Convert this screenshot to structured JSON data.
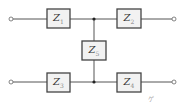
{
  "diagram": {
    "type": "two-port impedance network",
    "components": [
      {
        "id": "Z1",
        "symbol": "Z",
        "subscript": "1",
        "position": "top-left"
      },
      {
        "id": "Z2",
        "symbol": "Z",
        "subscript": "2",
        "position": "top-right"
      },
      {
        "id": "Z5",
        "symbol": "Z",
        "subscript": "5",
        "position": "center-shunt"
      },
      {
        "id": "Z3",
        "symbol": "Z",
        "subscript": "3",
        "position": "bottom-left"
      },
      {
        "id": "Z4",
        "symbol": "Z",
        "subscript": "4",
        "position": "bottom-right"
      }
    ],
    "terminals": [
      "top-left",
      "top-right",
      "bottom-left",
      "bottom-right"
    ],
    "junctions": [
      "top-center",
      "bottom-center"
    ],
    "note": "ゲ",
    "colors": {
      "wire": "#555555",
      "box_fill": "#f2f2f2",
      "box_stroke": "#444444"
    }
  }
}
